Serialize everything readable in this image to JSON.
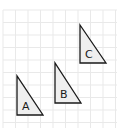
{
  "diagram": {
    "type": "grid-with-triangles",
    "grid": {
      "x0": 3,
      "y0": 10,
      "x1": 117,
      "y1": 128,
      "cell": 12.5,
      "color": "#e9e9e9"
    },
    "triangles": [
      {
        "label": "A",
        "points": [
          [
            17,
            76
          ],
          [
            17,
            115
          ],
          [
            43,
            115
          ]
        ],
        "label_pos": [
          22,
          110
        ]
      },
      {
        "label": "B",
        "points": [
          [
            55,
            63
          ],
          [
            55,
            103
          ],
          [
            81,
            103
          ]
        ],
        "label_pos": [
          60,
          98
        ]
      },
      {
        "label": "C",
        "points": [
          [
            80,
            25
          ],
          [
            80,
            63
          ],
          [
            106,
            63
          ]
        ],
        "label_pos": [
          85,
          58
        ]
      }
    ],
    "fill_color": "#efefef",
    "stroke_color": "#1a1a1a"
  }
}
